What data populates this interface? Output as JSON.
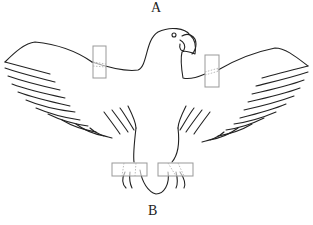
{
  "labels": {
    "top": "A",
    "bottom": "B"
  },
  "figure": {
    "attachments": [
      {
        "name": "left-wing-band"
      },
      {
        "name": "right-wing-band"
      },
      {
        "name": "left-foot-band"
      },
      {
        "name": "right-foot-band"
      }
    ],
    "colors": {
      "outline": "#222222",
      "band": "#999999",
      "background": "#ffffff"
    }
  }
}
